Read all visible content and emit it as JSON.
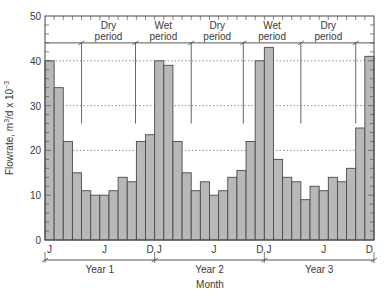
{
  "chart_data": {
    "type": "bar",
    "title": "",
    "xlabel": "Month",
    "ylabel": "Flowrate, m³/d × 10⁻³",
    "ylim": [
      0,
      50
    ],
    "yticks": [
      0,
      10,
      20,
      30,
      40,
      50
    ],
    "grid": "dotted horizontal at 20, 30, 40",
    "categories": [
      "Y1-Jan",
      "Y1-Feb",
      "Y1-Mar",
      "Y1-Apr",
      "Y1-May",
      "Y1-Jun",
      "Y1-Jul",
      "Y1-Aug",
      "Y1-Sep",
      "Y1-Oct",
      "Y1-Nov",
      "Y1-Dec",
      "Y2-Jan",
      "Y2-Feb",
      "Y2-Mar",
      "Y2-Apr",
      "Y2-May",
      "Y2-Jun",
      "Y2-Jul",
      "Y2-Aug",
      "Y2-Sep",
      "Y2-Oct",
      "Y2-Nov",
      "Y2-Dec",
      "Y3-Jan",
      "Y3-Feb",
      "Y3-Mar",
      "Y3-Apr",
      "Y3-May",
      "Y3-Jun",
      "Y3-Jul",
      "Y3-Aug",
      "Y3-Sep",
      "Y3-Oct",
      "Y3-Nov",
      "Y3-Dec"
    ],
    "values": [
      40,
      34,
      22,
      15,
      11,
      10,
      10,
      11,
      14,
      13,
      22,
      23.5,
      40,
      39,
      22,
      15,
      11,
      13,
      10,
      11,
      14,
      15.5,
      22,
      40,
      43,
      18,
      14,
      13,
      9,
      12,
      11,
      14,
      13,
      16,
      25,
      41
    ],
    "bar_color": "#b8b8b8",
    "x_month_labels": [
      {
        "month_index": 0,
        "label": "J"
      },
      {
        "month_index": 6,
        "label": "J"
      },
      {
        "month_index": 11,
        "label": "D"
      },
      {
        "month_index": 12,
        "label": "J"
      },
      {
        "month_index": 18,
        "label": "J"
      },
      {
        "month_index": 23,
        "label": "D"
      },
      {
        "month_index": 24,
        "label": "J"
      },
      {
        "month_index": 30,
        "label": "J"
      },
      {
        "month_index": 35,
        "label": "D"
      }
    ],
    "years": [
      {
        "label": "Year 1",
        "start": 0,
        "end": 12
      },
      {
        "label": "Year 2",
        "start": 12,
        "end": 24
      },
      {
        "label": "Year 3",
        "start": 24,
        "end": 36
      }
    ],
    "period_line_value": 44,
    "period_divider_bottom_value": 26,
    "period_dividers_month": [
      4,
      9.9,
      16,
      21.7,
      28,
      34
    ],
    "periods": [
      {
        "line1": "Dry",
        "line2": "period",
        "start": 4,
        "end": 9.9
      },
      {
        "line1": "Wet",
        "line2": "period",
        "start": 9.9,
        "end": 16
      },
      {
        "line1": "Dry",
        "line2": "period",
        "start": 16,
        "end": 21.7
      },
      {
        "line1": "Wet",
        "line2": "period",
        "start": 21.7,
        "end": 28
      },
      {
        "line1": "Dry",
        "line2": "period",
        "start": 28,
        "end": 34
      }
    ]
  },
  "labels": {
    "ylabel_main": "Flowrate, m",
    "ylabel_sup1": "3",
    "ylabel_mid": "/d x 10",
    "ylabel_sup2": "−3",
    "xlabel": "Month"
  }
}
